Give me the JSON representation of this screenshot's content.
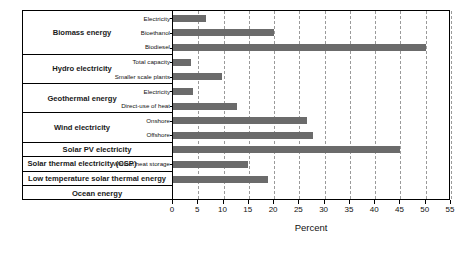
{
  "chart_data": {
    "type": "bar",
    "orientation": "horizontal",
    "title": "",
    "xlabel": "Percent",
    "ylabel": "",
    "xlim": [
      0,
      55
    ],
    "xticks": [
      0,
      5,
      10,
      15,
      20,
      25,
      30,
      35,
      40,
      45,
      50,
      55
    ],
    "grid": "vertical-dashed",
    "legend": "none",
    "bar_color": "#6b6b6b",
    "groups": [
      {
        "name": "Biomass energy",
        "subcategories": [
          {
            "label": "Electricity",
            "value": 6.5
          },
          {
            "label": "Bioethanol",
            "value": 20
          },
          {
            "label": "Biodiesel",
            "value": 50
          }
        ]
      },
      {
        "name": "Hydro electricity",
        "subcategories": [
          {
            "label": "Total capacity",
            "value": 3.5
          },
          {
            "label": "Smaller scale plants",
            "value": 9.7
          }
        ]
      },
      {
        "name": "Geothermal energy",
        "subcategories": [
          {
            "label": "Electricity",
            "value": 4
          },
          {
            "label": "Direct-use of heat",
            "value": 12.7
          }
        ]
      },
      {
        "name": "Wind electricity",
        "subcategories": [
          {
            "label": "Onshore",
            "value": 26.5
          },
          {
            "label": "Offshore",
            "value": 27.7
          }
        ]
      },
      {
        "name": "Solar PV electricity",
        "subcategories": [
          {
            "label": "",
            "value": 45
          }
        ]
      },
      {
        "name": "Solar thermal electricity (CSP)",
        "subcategories": [
          {
            "label": "Without heat storage",
            "value": 14.8
          }
        ]
      },
      {
        "name": "Low temperature solar thermal energy",
        "subcategories": [
          {
            "label": "",
            "value": 18.8
          }
        ]
      },
      {
        "name": "Ocean energy",
        "subcategories": [
          {
            "label": "",
            "value": 0
          }
        ]
      }
    ]
  }
}
